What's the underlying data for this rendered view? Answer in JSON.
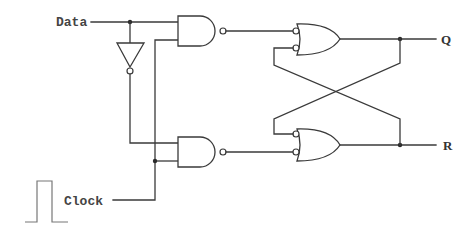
{
  "diagram": {
    "type": "logic-circuit",
    "labels": {
      "data": "Data",
      "clock": "Clock",
      "q": "Q",
      "r": "R"
    },
    "components": [
      {
        "id": "inverter",
        "type": "NOT"
      },
      {
        "id": "nand-top",
        "type": "NAND"
      },
      {
        "id": "nand-bottom",
        "type": "NAND"
      },
      {
        "id": "or-top",
        "type": "OR (inverted inputs)"
      },
      {
        "id": "or-bottom",
        "type": "OR (inverted inputs)"
      }
    ],
    "colors": {
      "wire": "#3a3a3a",
      "background": "#ffffff",
      "pulse": "#777777"
    }
  }
}
